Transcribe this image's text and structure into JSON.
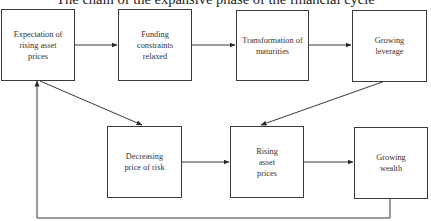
{
  "title": "The chain of the expansive phase of the financial cycle",
  "nodes": [
    {
      "id": "expectation",
      "label": "Expectation of rising asset prices"
    },
    {
      "id": "funding",
      "label": "Funding constraints relaxed"
    },
    {
      "id": "transformation",
      "label": "Transformation of maturities"
    },
    {
      "id": "leverage",
      "label": "Growing leverage"
    },
    {
      "id": "risk",
      "label": "Decreasing price of risk"
    },
    {
      "id": "rising",
      "label": "Rising asset prices"
    },
    {
      "id": "wealth",
      "label": "Growing wealth"
    }
  ],
  "edges": [
    {
      "from": "expectation",
      "to": "funding"
    },
    {
      "from": "funding",
      "to": "transformation"
    },
    {
      "from": "transformation",
      "to": "leverage"
    },
    {
      "from": "leverage",
      "to": "rising"
    },
    {
      "from": "expectation",
      "to": "risk"
    },
    {
      "from": "risk",
      "to": "rising"
    },
    {
      "from": "rising",
      "to": "wealth"
    },
    {
      "from": "wealth",
      "to": "expectation"
    }
  ],
  "colors": {
    "line": "#3a3a3a",
    "text": "#333333",
    "background": "#ffffff"
  }
}
